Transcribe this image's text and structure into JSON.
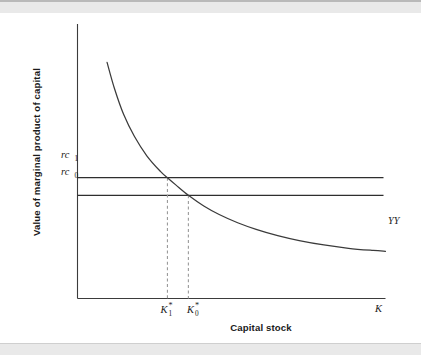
{
  "figure": {
    "background_color": "#ffffff",
    "band_color": "#e9e9e9",
    "ink_color": "#3b3b3b",
    "guide_color": "#9a9a9a"
  },
  "chart_data": {
    "type": "line",
    "title": "",
    "subtitle": "",
    "xlabel": "Capital stock",
    "ylabel": "Value of marginal product of capital",
    "xlim": [
      0,
      100
    ],
    "ylim": [
      0,
      100
    ],
    "grid": false,
    "legend_position": "inline-right",
    "axis_end_labels": {
      "x_axis_end": "K",
      "y_axis_end": ""
    },
    "series": [
      {
        "name": "YY",
        "label": "YY",
        "style": "solid",
        "description": "Downward sloping value of marginal product of capital schedule",
        "x": [
          9.6,
          12.0,
          15.0,
          18.5,
          22.5,
          27.0,
          29.2,
          32.0,
          36.0,
          41.0,
          46.0,
          52.0,
          58.0,
          65.0,
          72.0,
          80.0,
          88.0,
          96.0,
          100.0
        ],
        "y": [
          86.0,
          76.5,
          67.0,
          59.0,
          52.0,
          46.2,
          44.0,
          41.3,
          37.6,
          33.7,
          30.6,
          27.6,
          25.2,
          22.9,
          21.1,
          19.5,
          18.3,
          17.5,
          17.2
        ]
      },
      {
        "name": "rc1",
        "label": "rc",
        "label_subscript": "1",
        "style": "solid-horizontal",
        "description": "Higher user cost of capital",
        "y_value": 44.0,
        "x_from": 0,
        "x_to": 100
      },
      {
        "name": "rc0",
        "label": "rc",
        "label_subscript": "0",
        "style": "solid-horizontal",
        "description": "Lower user cost of capital",
        "y_value": 37.6,
        "x_from": 0,
        "x_to": 100
      }
    ],
    "guides": [
      {
        "name": "K1-star-guide",
        "style": "dashed",
        "x_value": 29.2,
        "y_from": 0,
        "y_to": 44.0,
        "tick_label": "K",
        "tick_superscript": "*",
        "tick_subscript": "1"
      },
      {
        "name": "K0-star-guide",
        "style": "dashed",
        "x_value": 36.0,
        "y_from": 0,
        "y_to": 37.6,
        "tick_label": "K",
        "tick_superscript": "*",
        "tick_subscript": "0"
      }
    ],
    "annotations": [
      {
        "name": "curve-label",
        "text": "YY",
        "x": 101.5,
        "y": 17.0
      },
      {
        "name": "x-axis-end-label",
        "text": "K",
        "x": 101.0,
        "y": -5.5
      }
    ],
    "intersections": [
      {
        "name": "equilibrium-1",
        "x": 29.2,
        "y": 44.0,
        "x_label": "K*1",
        "y_label": "rc1"
      },
      {
        "name": "equilibrium-0",
        "x": 36.0,
        "y": 37.6,
        "x_label": "K*0",
        "y_label": "rc0"
      }
    ]
  }
}
